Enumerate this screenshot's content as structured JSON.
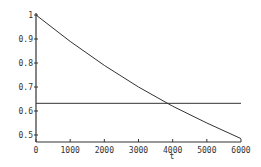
{
  "chart_data": {
    "type": "line",
    "title": "",
    "xlabel": "t",
    "ylabel": "",
    "xlim": [
      0,
      6000
    ],
    "ylim": [
      0.5,
      1.0
    ],
    "grid": false,
    "legend": null,
    "x_ticks": [
      "0",
      "1000",
      "2000",
      "3000",
      "4000",
      "5000",
      "6000"
    ],
    "y_ticks": [
      "0.5",
      "0.6",
      "0.7",
      "0.8",
      "0.9",
      "1"
    ],
    "series": [
      {
        "name": "decay curve",
        "x": [
          0,
          1000,
          2000,
          3000,
          4000,
          5000,
          6000
        ],
        "values": [
          1.0,
          0.89,
          0.79,
          0.7,
          0.62,
          0.55,
          0.485
        ]
      },
      {
        "name": "horizontal reference",
        "x": [
          0,
          6000
        ],
        "values": [
          0.632,
          0.632
        ]
      }
    ],
    "annotations": [
      {
        "text": "intersection near t≈3800",
        "x": 3800,
        "y": 0.632
      }
    ]
  }
}
